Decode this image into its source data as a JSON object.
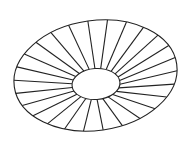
{
  "diagram": {
    "title": "",
    "description": "Tilted elliptical ring with radial spokes",
    "background": "#ffffff",
    "stroke_color": "#222222",
    "stroke_width": 1.1,
    "outer_ellipse": {
      "cx": 95.5,
      "cy": 75.5,
      "rx": 82,
      "ry": 55,
      "rotation_deg": -8
    },
    "inner_ellipse": {
      "cx": 96,
      "cy": 84,
      "rx": 24,
      "ry": 15.5,
      "rotation_deg": -4
    },
    "spoke_count": 26,
    "spoke_start_angle_deg": -90
  }
}
